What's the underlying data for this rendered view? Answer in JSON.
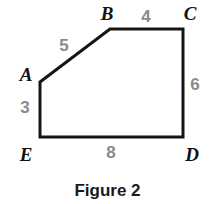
{
  "figure": {
    "caption": "Figure 2",
    "caption_y": 182,
    "background_color": "#ffffff",
    "stroke_color": "#151515",
    "stroke_width": 3,
    "vertex_label_color": "#111111",
    "side_label_color": "#8a8a8a",
    "shape_type": "pentagon",
    "shape_name": "ABCDE",
    "points_attr": "40,82 110,29 183,29 183,137 40,137",
    "vertices": [
      {
        "name": "A",
        "label": "A",
        "x": 40,
        "y": 82,
        "label_x": 26,
        "label_y": 74
      },
      {
        "name": "B",
        "label": "B",
        "x": 110,
        "y": 29,
        "label_x": 107,
        "label_y": 13
      },
      {
        "name": "C",
        "label": "C",
        "x": 183,
        "y": 29,
        "label_x": 190,
        "label_y": 13
      },
      {
        "name": "D",
        "label": "D",
        "x": 183,
        "y": 137,
        "label_x": 192,
        "label_y": 154
      },
      {
        "name": "E",
        "label": "E",
        "x": 40,
        "y": 137,
        "label_x": 26,
        "label_y": 154
      }
    ],
    "sides": [
      {
        "name": "AB",
        "label": "5",
        "from": "A",
        "to": "B",
        "label_x": 64,
        "label_y": 45
      },
      {
        "name": "BC",
        "label": "4",
        "from": "B",
        "to": "C",
        "label_x": 146,
        "label_y": 16
      },
      {
        "name": "CD",
        "label": "6",
        "from": "C",
        "to": "D",
        "label_x": 195,
        "label_y": 84
      },
      {
        "name": "DE",
        "label": "8",
        "from": "D",
        "to": "E",
        "label_x": 111,
        "label_y": 152
      },
      {
        "name": "EA",
        "label": "3",
        "from": "E",
        "to": "A",
        "label_x": 25,
        "label_y": 107
      }
    ]
  }
}
